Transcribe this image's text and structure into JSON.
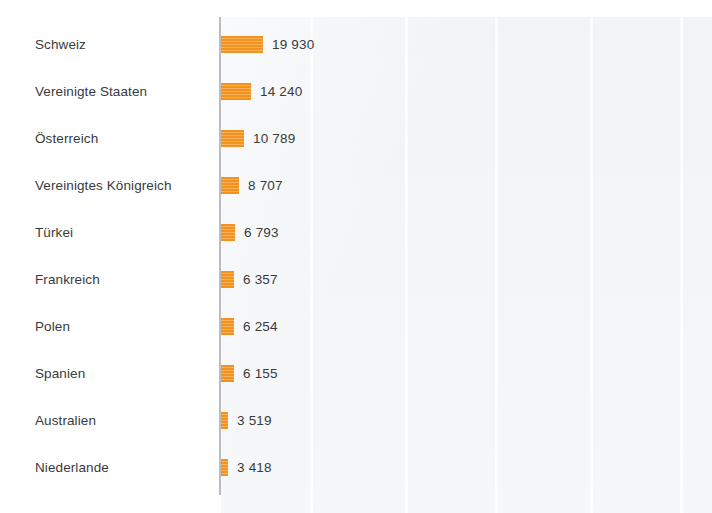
{
  "chart_data": {
    "type": "bar",
    "orientation": "horizontal",
    "title": "",
    "subtitle": "",
    "xlabel": "",
    "ylabel": "",
    "grid": "vertical-faint",
    "legend": "none",
    "xlim": [
      0,
      19930
    ],
    "categories": [
      "Schweiz",
      "Vereinigte Staaten",
      "Österreich",
      "Vereinigtes Königreich",
      "Türkei",
      "Frankreich",
      "Polen",
      "Spanien",
      "Australien",
      "Niederlande"
    ],
    "values": [
      19930,
      14240,
      10789,
      8707,
      6793,
      6357,
      6254,
      6155,
      3519,
      3418
    ],
    "value_labels": [
      "19 930",
      "14 240",
      "10 789",
      "8 707",
      "6 793",
      "6 357",
      "6 254",
      "6 155",
      "3 519",
      "3 418"
    ],
    "bar_color": "#f5921e",
    "axis_color": "#b9bdc1",
    "panel_color": "#f2f4f6",
    "text_color": "#3a3a3c"
  },
  "rows": [
    {
      "label": "Schweiz",
      "value_label": "19 930",
      "value": 19930
    },
    {
      "label": "Vereinigte Staaten",
      "value_label": "14 240",
      "value": 14240
    },
    {
      "label": "Österreich",
      "value_label": "10 789",
      "value": 10789
    },
    {
      "label": "Vereinigtes Königreich",
      "value_label": "8 707",
      "value": 8707
    },
    {
      "label": "Türkei",
      "value_label": "6 793",
      "value": 6793
    },
    {
      "label": "Frankreich",
      "value_label": "6 357",
      "value": 6357
    },
    {
      "label": "Polen",
      "value_label": "6 254",
      "value": 6254
    },
    {
      "label": "Spanien",
      "value_label": "6 155",
      "value": 6155
    },
    {
      "label": "Australien",
      "value_label": "3 519",
      "value": 3519
    },
    {
      "label": "Niederlande",
      "value_label": "3 418",
      "value": 3418
    }
  ],
  "gridlines_x": [
    89,
    184,
    274,
    369,
    459
  ]
}
